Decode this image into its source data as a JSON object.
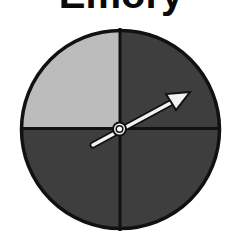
{
  "title": "Emory",
  "spinner": {
    "sections": [
      {
        "position": "top-left",
        "color": "#bcbcbc",
        "shade": "light"
      },
      {
        "position": "top-right",
        "color": "#3e3e3e",
        "shade": "dark"
      },
      {
        "position": "bottom-right",
        "color": "#3e3e3e",
        "shade": "dark"
      },
      {
        "position": "bottom-left",
        "color": "#3e3e3e",
        "shade": "dark"
      }
    ],
    "outline_color": "#111111",
    "arrow_color": "#f2f2f2",
    "arrow_direction": "upper-right"
  }
}
